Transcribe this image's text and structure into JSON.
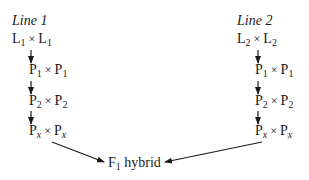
{
  "line1": {
    "title": "Line 1",
    "steps": [
      {
        "a": "L",
        "a_sub": "1",
        "b": "L",
        "b_sub": "1"
      },
      {
        "a": "P",
        "a_sub": "1",
        "b": "P",
        "b_sub": "1"
      },
      {
        "a": "P",
        "a_sub": "2",
        "b": "P",
        "b_sub": "2"
      },
      {
        "a": "P",
        "a_sub": "x",
        "b": "P",
        "b_sub": "x"
      }
    ]
  },
  "line2": {
    "title": "Line 2",
    "steps": [
      {
        "a": "L",
        "a_sub": "2",
        "b": "L",
        "b_sub": "2"
      },
      {
        "a": "P",
        "a_sub": "1",
        "b": "P",
        "b_sub": "1"
      },
      {
        "a": "P",
        "a_sub": "2",
        "b": "P",
        "b_sub": "2"
      },
      {
        "a": "P",
        "a_sub": "x",
        "b": "P",
        "b_sub": "x"
      }
    ]
  },
  "cross_symbol": "×",
  "result": {
    "a": "F",
    "a_sub": "1",
    "label": "hybrid"
  }
}
